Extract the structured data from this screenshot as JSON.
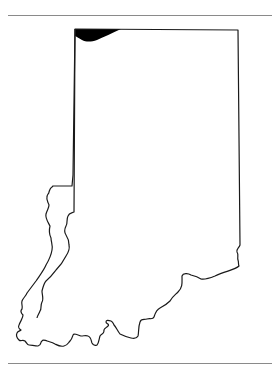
{
  "map": {
    "subject": "Indiana state outline",
    "style": "black outline on white, no labels",
    "features": [
      {
        "name": "state-boundary",
        "type": "outline",
        "color": "#000000"
      },
      {
        "name": "lake-michigan",
        "type": "filled-water-body",
        "color": "#000000"
      }
    ],
    "colors": {
      "background": "#ffffff",
      "outline": "#1a1a1a",
      "water_fill": "#000000",
      "rule": "#8a8a8a"
    }
  }
}
